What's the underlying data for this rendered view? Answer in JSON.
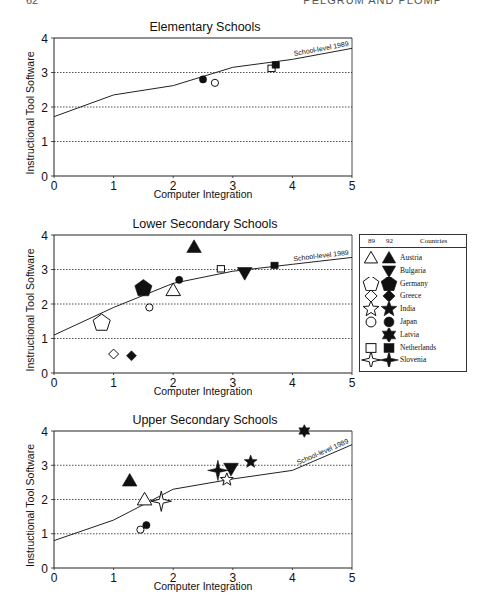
{
  "page": {
    "number": "62",
    "running_head": "PELGRUM AND PLOMP"
  },
  "legend": {
    "col_89": "89",
    "col_92": "92",
    "col_countries": "Countries",
    "entries": [
      {
        "country": "Austria",
        "marker89": "triangle-up-open",
        "marker92": "triangle-up-filled"
      },
      {
        "country": "Bulgaria",
        "marker89": null,
        "marker92": "triangle-down-filled"
      },
      {
        "country": "Germany",
        "marker89": "pentagon-open",
        "marker92": "pentagon-filled"
      },
      {
        "country": "Greece",
        "marker89": "diamond-open",
        "marker92": "diamond-filled"
      },
      {
        "country": "India",
        "marker89": "star5-open",
        "marker92": "star5-filled"
      },
      {
        "country": "Japan",
        "marker89": "circle-open",
        "marker92": "circle-filled"
      },
      {
        "country": "Latvia",
        "marker89": null,
        "marker92": "star6-filled"
      },
      {
        "country": "Netherlands",
        "marker89": "square-open",
        "marker92": "square-filled"
      },
      {
        "country": "Slovenia",
        "marker89": "star4-open",
        "marker92": "star4-filled"
      }
    ]
  },
  "chart_data": [
    {
      "type": "scatter",
      "title": "Elementary Schools",
      "xlabel": "Computer Integration",
      "ylabel": "Instructional Tool Software",
      "xlim": [
        0,
        5
      ],
      "ylim": [
        0,
        4
      ],
      "xticks": [
        "0",
        "1",
        "2",
        "3",
        "4",
        "5"
      ],
      "yticks": [
        "0",
        "1",
        "2",
        "3",
        "4"
      ],
      "grid": "horizontal dotted at 1,2,3",
      "reference_line": {
        "label": "School-level 1989",
        "x": [
          0,
          1,
          2,
          3,
          4,
          5
        ],
        "y": [
          1.72,
          2.35,
          2.62,
          3.15,
          3.38,
          3.7
        ]
      },
      "points": [
        {
          "country": "Japan",
          "year": "92",
          "x": 2.5,
          "y": 2.8
        },
        {
          "country": "Japan",
          "year": "89",
          "x": 2.7,
          "y": 2.7
        },
        {
          "country": "Netherlands",
          "year": "89",
          "x": 3.65,
          "y": 3.12
        },
        {
          "country": "Netherlands",
          "year": "92",
          "x": 3.72,
          "y": 3.22
        }
      ]
    },
    {
      "type": "scatter",
      "title": "Lower Secondary Schools",
      "xlabel": "Computer Integration",
      "ylabel": "Instructional Tool Software",
      "xlim": [
        0,
        5
      ],
      "ylim": [
        0,
        4
      ],
      "xticks": [
        "0",
        "1",
        "2",
        "3",
        "4",
        "5"
      ],
      "yticks": [
        "0",
        "1",
        "2",
        "3",
        "4"
      ],
      "grid": "horizontal dotted at 1,2,3",
      "reference_line": {
        "label": "School-level 1989",
        "x": [
          0,
          1,
          2,
          3,
          4,
          5
        ],
        "y": [
          1.1,
          1.9,
          2.6,
          2.95,
          3.15,
          3.35
        ]
      },
      "points": [
        {
          "country": "Germany",
          "year": "89",
          "x": 0.8,
          "y": 1.45
        },
        {
          "country": "Greece",
          "year": "89",
          "x": 1.0,
          "y": 0.55
        },
        {
          "country": "Greece",
          "year": "92",
          "x": 1.3,
          "y": 0.5
        },
        {
          "country": "Germany",
          "year": "92",
          "x": 1.5,
          "y": 2.45
        },
        {
          "country": "Japan",
          "year": "89",
          "x": 1.6,
          "y": 1.9
        },
        {
          "country": "Austria",
          "year": "89",
          "x": 2.0,
          "y": 2.4
        },
        {
          "country": "Japan",
          "year": "92",
          "x": 2.1,
          "y": 2.7
        },
        {
          "country": "Austria",
          "year": "92",
          "x": 2.35,
          "y": 3.65
        },
        {
          "country": "Netherlands",
          "year": "89",
          "x": 2.8,
          "y": 3.02
        },
        {
          "country": "Bulgaria",
          "year": "92",
          "x": 3.2,
          "y": 2.9
        },
        {
          "country": "Netherlands",
          "year": "92",
          "x": 3.7,
          "y": 3.12
        }
      ]
    },
    {
      "type": "scatter",
      "title": "Upper Secondary Schools",
      "xlabel": "Computer Integration",
      "ylabel": "Instructional Tool Software",
      "xlim": [
        0,
        5
      ],
      "ylim": [
        0,
        4
      ],
      "xticks": [
        "0",
        "1",
        "2",
        "3",
        "4",
        "5"
      ],
      "yticks": [
        "0",
        "1",
        "2",
        "3",
        "4"
      ],
      "grid": "horizontal dotted at 1,2,3",
      "reference_line": {
        "label": "School-level 1989",
        "x": [
          0,
          1,
          2,
          3,
          4,
          5
        ],
        "y": [
          0.8,
          1.4,
          2.3,
          2.6,
          2.85,
          3.6
        ]
      },
      "points": [
        {
          "country": "Austria",
          "year": "92",
          "x": 1.27,
          "y": 2.55
        },
        {
          "country": "Japan",
          "year": "89",
          "x": 1.45,
          "y": 1.12
        },
        {
          "country": "Austria",
          "year": "89",
          "x": 1.52,
          "y": 2.0
        },
        {
          "country": "Japan",
          "year": "92",
          "x": 1.55,
          "y": 1.25
        },
        {
          "country": "Slovenia",
          "year": "89",
          "x": 1.8,
          "y": 1.95
        },
        {
          "country": "Slovenia",
          "year": "92",
          "x": 2.75,
          "y": 2.85
        },
        {
          "country": "India",
          "year": "89",
          "x": 2.9,
          "y": 2.58
        },
        {
          "country": "Bulgaria",
          "year": "92",
          "x": 2.97,
          "y": 2.9
        },
        {
          "country": "India",
          "year": "92",
          "x": 3.3,
          "y": 3.1
        },
        {
          "country": "Latvia",
          "year": "92",
          "x": 4.2,
          "y": 4.0
        }
      ]
    }
  ]
}
